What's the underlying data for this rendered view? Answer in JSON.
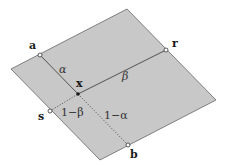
{
  "diagram": {
    "colors": {
      "fill": "#c8c8c8",
      "edge": "#666666",
      "line": "#444444",
      "background": "#ffffff"
    },
    "polygon": {
      "vertices": [
        [
          11,
          69
        ],
        [
          127,
          9
        ],
        [
          216,
          100
        ],
        [
          100,
          160
        ]
      ]
    },
    "points": {
      "a": {
        "label": "a",
        "pos": [
          40,
          55
        ],
        "label_pos": [
          29,
          49
        ]
      },
      "r": {
        "label": "r",
        "pos": [
          166,
          50
        ],
        "label_pos": [
          172,
          47
        ]
      },
      "s": {
        "label": "s",
        "pos": [
          50,
          111
        ],
        "label_pos": [
          38,
          120
        ]
      },
      "b": {
        "label": "b",
        "pos": [
          128,
          145
        ],
        "label_pos": [
          130,
          158
        ]
      },
      "x": {
        "label": "x",
        "pos": [
          78,
          94
        ],
        "label_pos": [
          76,
          87
        ]
      }
    },
    "segments": {
      "a_to_x": {
        "from": "a",
        "to": "x",
        "style": "solid"
      },
      "x_to_r": {
        "from": "x",
        "to": "r",
        "style": "solid"
      },
      "s_to_x": {
        "from": "s",
        "to": "x",
        "style": "dotted"
      },
      "x_to_b": {
        "from": "x",
        "to": "b",
        "style": "dotted"
      }
    },
    "segment_labels": {
      "alpha": {
        "text": "α",
        "pos": [
          59,
          73
        ]
      },
      "beta": {
        "text": "β",
        "pos": [
          122,
          80
        ]
      },
      "one_minus_beta": {
        "text": "1−β",
        "pos": [
          61,
          116
        ]
      },
      "one_minus_alpha": {
        "text": "1−α",
        "pos": [
          104,
          119
        ]
      }
    }
  }
}
